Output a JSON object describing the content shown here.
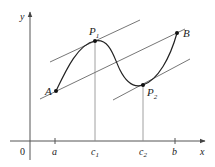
{
  "diagram": {
    "axes": {
      "x_label": "x",
      "y_label": "y",
      "origin_label": "0"
    },
    "ticks": [
      {
        "label": "a",
        "sub": ""
      },
      {
        "label": "c",
        "sub": "1"
      },
      {
        "label": "c",
        "sub": "2"
      },
      {
        "label": "b",
        "sub": ""
      }
    ],
    "points": {
      "A": {
        "label": "A",
        "sub": ""
      },
      "P1": {
        "label": "P",
        "sub": "1"
      },
      "P2": {
        "label": "P",
        "sub": "2"
      },
      "B": {
        "label": "B",
        "sub": ""
      }
    },
    "colors": {
      "curve": "#222222",
      "lines": "#666666",
      "axes": "#555555",
      "guides": "#888888"
    }
  }
}
